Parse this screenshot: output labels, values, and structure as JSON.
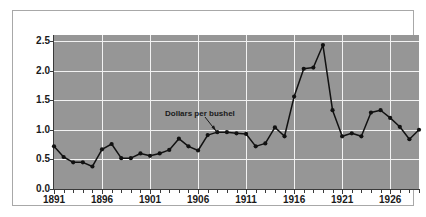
{
  "figure": {
    "background_color": "#ffffff",
    "frame_color": "#a8a8a8",
    "plot_background_color": "#969696",
    "gridline_color": "#f2f2f2",
    "series_color": "#111111"
  },
  "annotation": {
    "label": "Dollars per bushel"
  },
  "chart_data": {
    "type": "line",
    "title": "",
    "subtitle": "",
    "xlabel": "",
    "ylabel": "",
    "ylim": [
      0.0,
      2.6
    ],
    "xlim": [
      1891,
      1929
    ],
    "grid": true,
    "legend_position": "none",
    "annotations": [
      {
        "text": "Dollars per bushel",
        "points_to_x": 1907,
        "points_to_y": 0.91
      }
    ],
    "ytick_labels": [
      "0.0",
      "0.5",
      "1.0",
      "1.5",
      "2.0",
      "2.5"
    ],
    "ytick_values": [
      0.0,
      0.5,
      1.0,
      1.5,
      2.0,
      2.5
    ],
    "xtick_labels": [
      "1891",
      "1896",
      "1901",
      "1906",
      "1911",
      "1916",
      "1921",
      "1926"
    ],
    "xtick_values": [
      1891,
      1896,
      1901,
      1906,
      1911,
      1916,
      1921,
      1926
    ],
    "x": [
      1891,
      1892,
      1893,
      1894,
      1895,
      1896,
      1897,
      1898,
      1899,
      1900,
      1901,
      1902,
      1903,
      1904,
      1905,
      1906,
      1907,
      1908,
      1909,
      1910,
      1911,
      1912,
      1913,
      1914,
      1915,
      1916,
      1917,
      1918,
      1919,
      1920,
      1921,
      1922,
      1923,
      1924,
      1925,
      1926,
      1927,
      1928,
      1929
    ],
    "series": [
      {
        "name": "Dollars per bushel",
        "values": [
          0.72,
          0.54,
          0.45,
          0.45,
          0.38,
          0.67,
          0.76,
          0.52,
          0.52,
          0.6,
          0.56,
          0.6,
          0.66,
          0.85,
          0.72,
          0.65,
          0.91,
          0.96,
          0.96,
          0.94,
          0.93,
          0.72,
          0.77,
          1.04,
          0.89,
          1.56,
          2.03,
          2.05,
          2.43,
          1.33,
          0.89,
          0.94,
          0.89,
          1.29,
          1.33,
          1.2,
          1.05,
          0.84,
          1.0
        ]
      }
    ]
  }
}
